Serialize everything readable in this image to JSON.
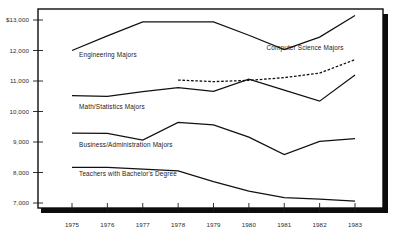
{
  "chart_data": {
    "type": "line",
    "title": "",
    "subtitle": "",
    "xlabel": "",
    "ylabel": "",
    "x": [
      1975,
      1976,
      1977,
      1978,
      1979,
      1980,
      1981,
      1982,
      1983
    ],
    "categories": [
      "1975",
      "1976",
      "1977",
      "1978",
      "1979",
      "1980",
      "1981",
      "1982",
      "1983"
    ],
    "xlim": [
      1974.5,
      1983.6
    ],
    "ylim": [
      6700,
      13350
    ],
    "yticks": [
      7000,
      8000,
      9000,
      10000,
      11000,
      12000,
      13000
    ],
    "ytick_labels": [
      "7,000",
      "8,000",
      "9,000",
      "10,000",
      "11,000",
      "12,000",
      "$13,000"
    ],
    "grid": false,
    "legend_position": "inline-annotations",
    "series": [
      {
        "name": "Engineering Majors",
        "style": "solid",
        "x": [
          1975,
          1976,
          1977,
          1978,
          1979,
          1980,
          1981,
          1982,
          1983
        ],
        "values": [
          12000,
          12480,
          12940,
          12940,
          12940,
          12500,
          12030,
          12440,
          13150
        ]
      },
      {
        "name": "Computer Science Majors",
        "style": "dashed",
        "x": [
          1978,
          1979,
          1980,
          1981,
          1982,
          1983
        ],
        "values": [
          11030,
          10980,
          11020,
          11110,
          11260,
          11700
        ]
      },
      {
        "name": "Math/Statistics Majors",
        "style": "solid",
        "x": [
          1975,
          1976,
          1977,
          1978,
          1979,
          1980,
          1981,
          1982,
          1983
        ],
        "values": [
          10520,
          10500,
          10650,
          10780,
          10660,
          11060,
          10700,
          10340,
          11200
        ]
      },
      {
        "name": "Business/Administration Majors",
        "style": "solid",
        "x": [
          1975,
          1976,
          1977,
          1978,
          1979,
          1980,
          1981,
          1982,
          1983
        ],
        "values": [
          9290,
          9280,
          9060,
          9640,
          9560,
          9160,
          8590,
          9020,
          9110
        ]
      },
      {
        "name": "Teachers with Bachelor's Degree",
        "style": "solid",
        "x": [
          1975,
          1976,
          1977,
          1978,
          1979,
          1980,
          1981,
          1982,
          1983
        ],
        "values": [
          8170,
          8170,
          8110,
          8050,
          7700,
          7390,
          7180,
          7130,
          7060
        ]
      }
    ],
    "annotations": [
      {
        "text": "Engineering Majors",
        "x": 1975.2,
        "y": 11780
      },
      {
        "text": "Computer Science Majors",
        "x": 1980.5,
        "y": 12020
      },
      {
        "text": "Math/Statistics Majors",
        "x": 1975.2,
        "y": 10080
      },
      {
        "text": "Business/Administration Majors",
        "x": 1975.2,
        "y": 8850
      },
      {
        "text": "Teachers with Bachelor's Degree",
        "x": 1975.2,
        "y": 7880
      }
    ]
  },
  "axes": {
    "y_labels": [
      "$13,000",
      "12,000",
      "11,000",
      "10,000",
      "9,000",
      "8,000",
      "7,000"
    ],
    "x_labels": [
      "1975",
      "1976",
      "1977",
      "1978",
      "1979",
      "1980",
      "1981",
      "1982",
      "1983"
    ]
  },
  "series_labels": {
    "engineering": "Engineering Majors",
    "computer_science": "Computer Science Majors",
    "math_statistics": "Math/Statistics Majors",
    "business": "Business/Administration Majors",
    "teachers": "Teachers with Bachelor's Degree"
  },
  "colors": {
    "line": "#111111",
    "frame": "#0d0d0d",
    "text": "#2b2b2b",
    "background": "#ffffff"
  }
}
